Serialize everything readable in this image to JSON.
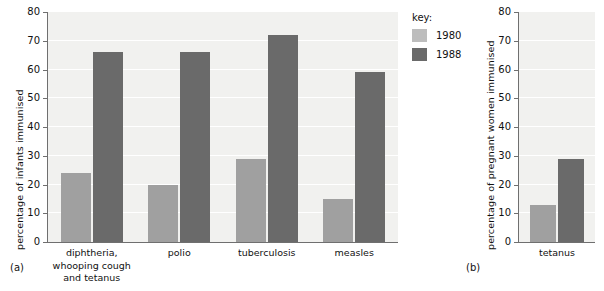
{
  "legend": {
    "title": "key:",
    "entries": [
      {
        "label": "1980",
        "color": "#bdbdbd"
      },
      {
        "label": "1988",
        "color": "#6a6a6a"
      }
    ]
  },
  "panels": {
    "a": {
      "caption": "(a)"
    },
    "b": {
      "caption": "(b)"
    }
  },
  "chart_data": [
    {
      "id": "a",
      "type": "bar",
      "title": "",
      "xlabel": "",
      "ylabel": "percentage of infants immunised",
      "ylim": [
        0,
        80
      ],
      "yticks": [
        0,
        10,
        20,
        30,
        40,
        50,
        60,
        70,
        80
      ],
      "grid": true,
      "legend_position": "right-outside",
      "categories": [
        "diphtheria,\nwhooping cough\nand tetanus",
        "polio",
        "tuberculosis",
        "measles"
      ],
      "category_lines": [
        [
          "diphtheria,",
          "whooping cough",
          "and tetanus"
        ],
        [
          "polio"
        ],
        [
          "tuberculosis"
        ],
        [
          "measles"
        ]
      ],
      "series": [
        {
          "name": "1980",
          "color": "#a0a0a0",
          "values": [
            24,
            20,
            29,
            15
          ]
        },
        {
          "name": "1988",
          "color": "#6a6a6a",
          "values": [
            66,
            66,
            72,
            59
          ]
        }
      ]
    },
    {
      "id": "b",
      "type": "bar",
      "title": "",
      "xlabel": "",
      "ylabel": "percentage of pregnant women immunised",
      "ylim": [
        0,
        80
      ],
      "yticks": [
        0,
        10,
        20,
        30,
        40,
        50,
        60,
        70,
        80
      ],
      "grid": true,
      "legend_position": "shared",
      "categories": [
        "tetanus"
      ],
      "category_lines": [
        [
          "tetanus"
        ]
      ],
      "series": [
        {
          "name": "1980",
          "color": "#a0a0a0",
          "values": [
            13
          ]
        },
        {
          "name": "1988",
          "color": "#6a6a6a",
          "values": [
            29
          ]
        }
      ]
    }
  ]
}
